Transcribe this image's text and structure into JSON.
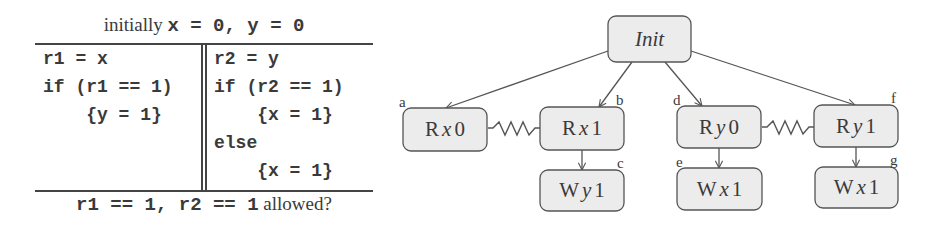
{
  "table": {
    "header": {
      "prefix": "initially ",
      "code": "x = 0, y = 0"
    },
    "thread1": {
      "lines": [
        "r1 = x",
        "if (r1 == 1)",
        "    {y = 1}"
      ]
    },
    "thread2": {
      "lines": [
        "r2 = y",
        "if (r2 == 1)",
        "    {x = 1}",
        "else",
        "    {x = 1}"
      ]
    },
    "footer": {
      "code": "r1 == 1, r2 == 1",
      "suffix": " allowed?"
    }
  },
  "diagram": {
    "root": {
      "label": "Init"
    },
    "nodes": [
      {
        "id": "a",
        "op": "R",
        "var": "x",
        "val": "0",
        "tag": "a"
      },
      {
        "id": "b",
        "op": "R",
        "var": "x",
        "val": "1",
        "tag": "b"
      },
      {
        "id": "c",
        "op": "W",
        "var": "y",
        "val": "1",
        "tag": "c"
      },
      {
        "id": "d",
        "op": "R",
        "var": "y",
        "val": "0",
        "tag": "d"
      },
      {
        "id": "e",
        "op": "W",
        "var": "x",
        "val": "1",
        "tag": "e"
      },
      {
        "id": "f",
        "op": "R",
        "var": "y",
        "val": "1",
        "tag": "f"
      },
      {
        "id": "g",
        "op": "W",
        "var": "x",
        "val": "1",
        "tag": "g"
      }
    ],
    "edges": [
      {
        "from": "Init",
        "to": "a",
        "kind": "arrow"
      },
      {
        "from": "Init",
        "to": "b",
        "kind": "arrow"
      },
      {
        "from": "Init",
        "to": "d",
        "kind": "arrow"
      },
      {
        "from": "Init",
        "to": "f",
        "kind": "arrow"
      },
      {
        "from": "b",
        "to": "c",
        "kind": "arrow"
      },
      {
        "from": "d",
        "to": "e",
        "kind": "arrow"
      },
      {
        "from": "f",
        "to": "g",
        "kind": "arrow"
      },
      {
        "from": "a",
        "to": "b",
        "kind": "conflict-zigzag"
      },
      {
        "from": "d",
        "to": "f",
        "kind": "conflict-zigzag"
      }
    ],
    "colors": {
      "node_fill": "#ececec",
      "node_stroke": "#555555",
      "edge": "#555555"
    }
  }
}
